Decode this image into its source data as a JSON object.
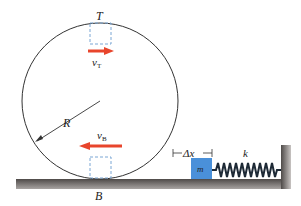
{
  "diagram": {
    "labels": {
      "top_point": "T",
      "bottom_point": "B",
      "radius": "R",
      "velocity_top": "v",
      "velocity_top_sub": "T",
      "velocity_bottom": "v",
      "velocity_bottom_sub": "B",
      "compression": "Δx",
      "spring_constant": "k",
      "mass": "m"
    },
    "colors": {
      "arrow": "#e8452c",
      "block": "#4a90d9",
      "dashed_box": "#7aa6d4",
      "ground": "#6e6a68",
      "spring": "#1e2a36",
      "circle": "#333333"
    }
  }
}
